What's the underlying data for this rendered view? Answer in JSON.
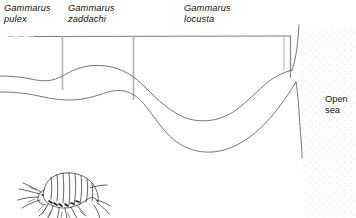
{
  "figure": {
    "type": "schematic-distribution-diagram",
    "width": 356,
    "height": 218,
    "background_color": "#ffffff",
    "line_color": "#3a3a3a",
    "text_color": "#111111"
  },
  "labels": {
    "species": [
      {
        "genus": "Gammarus",
        "epithet": "pulex",
        "zone": "freshwater-upper-estuary"
      },
      {
        "genus": "Gammarus",
        "epithet": "zaddachi",
        "zone": "middle-estuary-brackish"
      },
      {
        "genus": "Gammarus",
        "epithet": "locusta",
        "zone": "lower-estuary-marine"
      }
    ],
    "open_sea": {
      "line1": "Open",
      "line2": "sea"
    }
  },
  "zone_axis": {
    "baseline_y": 36,
    "style": "horizontal-rule-with-vertical-zone-dividers",
    "left_segment_style": "dashed",
    "dividers_x": [
      62,
      133,
      290
    ],
    "extent_x": [
      8,
      292
    ]
  },
  "illustration": {
    "name": "amphipod",
    "common_name": "freshwater shrimp (Gammarus)",
    "position": {
      "x": 18,
      "y": 168,
      "width": 92,
      "height": 48
    }
  },
  "stipple": {
    "region": "open-sea",
    "description": "light dotted texture seaward of the coastline",
    "color": "#c9c9c9"
  },
  "colors": {
    "ink": "#3a3a3a",
    "text": "#111111",
    "stipple": "#c9c9c9",
    "paper": "#ffffff"
  }
}
